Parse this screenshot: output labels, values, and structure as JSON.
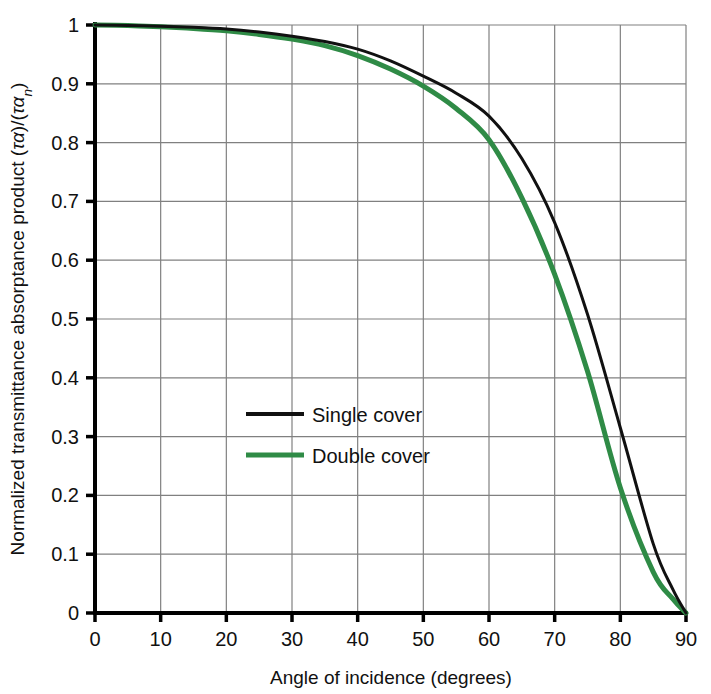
{
  "chart_data": {
    "type": "line",
    "title": "",
    "xlabel": "Angle of incidence (degrees)",
    "ylabel_parts": {
      "main": "Normalized transmittance absorptance product ",
      "open1": "(",
      "tau1": "τα",
      "close1": ")/(",
      "tau2": "τα",
      "sub": "n",
      "close2": ")"
    },
    "ylabel_plain": "Normalized transmittance absorptance product (τα)/(ταn)",
    "xlim": [
      0,
      90
    ],
    "ylim": [
      0,
      1
    ],
    "xticks": [
      0,
      10,
      20,
      30,
      40,
      50,
      60,
      70,
      80,
      90
    ],
    "xtick_labels": [
      "0",
      "10",
      "20",
      "30",
      "40",
      "50",
      "60",
      "70",
      "80",
      "90"
    ],
    "yticks": [
      0,
      0.1,
      0.2,
      0.3,
      0.4,
      0.5,
      0.6,
      0.7,
      0.8,
      0.9,
      1
    ],
    "ytick_labels": [
      "0",
      "0.1",
      "0.2",
      "0.3",
      "0.4",
      "0.5",
      "0.6",
      "0.7",
      "0.8",
      "0.9",
      "1"
    ],
    "grid": true,
    "grid_color": "#808080",
    "axis_color": "#000000",
    "legend_position": "center-left-inside",
    "x": [
      0,
      5,
      10,
      15,
      20,
      25,
      30,
      35,
      40,
      45,
      50,
      55,
      60,
      65,
      70,
      75,
      80,
      85,
      88,
      90
    ],
    "series": [
      {
        "name": "Single cover",
        "color": "#111111",
        "width": 3.0,
        "values": [
          1.0,
          0.999,
          0.998,
          0.996,
          0.993,
          0.988,
          0.981,
          0.972,
          0.959,
          0.939,
          0.913,
          0.884,
          0.845,
          0.773,
          0.664,
          0.508,
          0.315,
          0.118,
          0.04,
          0.0
        ]
      },
      {
        "name": "Double cover",
        "color": "#2f8b46",
        "width": 5.0,
        "values": [
          1.0,
          0.999,
          0.997,
          0.994,
          0.99,
          0.984,
          0.976,
          0.965,
          0.948,
          0.925,
          0.896,
          0.858,
          0.805,
          0.706,
          0.576,
          0.411,
          0.213,
          0.07,
          0.024,
          0.0
        ]
      }
    ],
    "legend_entries": [
      {
        "label": "Single cover",
        "color": "#111111",
        "width": 4.0
      },
      {
        "label": "Double cover",
        "color": "#2f8b46",
        "width": 5.0
      }
    ]
  }
}
